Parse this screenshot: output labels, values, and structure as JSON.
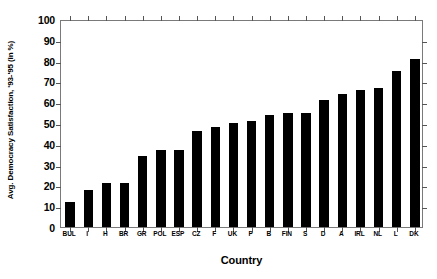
{
  "chart_data": {
    "type": "bar",
    "title": "",
    "xlabel": "Country",
    "ylabel": "Avg. Democracy Satisfaction, '93-'95 (in %)",
    "categories": [
      "BUL",
      "I",
      "H",
      "BR",
      "GR",
      "POL",
      "ESP",
      "CZ",
      "F",
      "UK",
      "P",
      "B",
      "FIN",
      "S",
      "D",
      "A",
      "IRL",
      "NL",
      "L",
      "DK"
    ],
    "values": [
      12,
      18,
      21,
      21,
      34,
      37,
      37,
      46,
      48,
      50,
      51,
      54,
      55,
      55,
      61,
      64,
      66,
      67,
      75,
      81
    ],
    "ylim": [
      0,
      100
    ],
    "ytick_labels": [
      "100",
      "90",
      "80",
      "70",
      "60",
      "50",
      "40",
      "30",
      "20",
      "10",
      "0"
    ],
    "ytick_values": [
      100,
      90,
      80,
      70,
      60,
      50,
      40,
      30,
      20,
      10,
      0
    ],
    "ytick_step": 10,
    "grid": false,
    "legend": null,
    "bar_color": "#000000",
    "frame_color": "#7a7a7a",
    "background": "#ffffff"
  }
}
